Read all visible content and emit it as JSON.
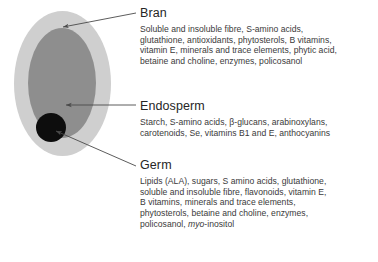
{
  "figure": {
    "colors": {
      "bran": "#cfcfcf",
      "endosperm": "#8e8e8e",
      "germ": "#0d0d0d",
      "leader_line": "#5a5a5a",
      "heading_text": "#262626",
      "body_text": "#3a3a3a"
    },
    "parts": [
      {
        "id": "bran",
        "heading": "Bran",
        "body": "Soluble and insoluble fibre, S-amino acids, glutathione, antioxidants, phytosterols, B vitamins, vitamin E, minerals and trace elements, phytic acid, betaine and choline, enzymes, policosanol",
        "lines": [
          "Soluble and insoluble fibre, S-amino acids,",
          "glutathione, antioxidants, phytosterols, B vitamins,",
          "vitamin E, minerals and trace elements, phytic acid,",
          "betaine and choline, enzymes, policosanol"
        ]
      },
      {
        "id": "endosperm",
        "heading": "Endosperm",
        "body": "Starch, S-amino acids, β-glucans, arabinoxylans, carotenoids, Se, vitamins B1 and E, anthocyanins",
        "lines": [
          "Starch, S-amino acids, β-glucans, arabinoxylans,",
          "carotenoids, Se, vitamins B1 and E, anthocyanins"
        ]
      },
      {
        "id": "germ",
        "heading": "Germ",
        "body": "Lipids (ALA), sugars, S amino acids, glutathione, soluble and insoluble fibre, flavonoids, vitamin E, B vitamins, minerals and trace elements, phytosterols, betaine and choline, enzymes, policosanol, myo-inositol",
        "lines": [
          "Lipids (ALA), sugars, S amino acids, glutathione,",
          "soluble and insoluble fibre, flavonoids, vitamin E,",
          "B vitamins, minerals and trace elements,",
          "phytosterols, betaine and choline, enzymes,",
          "policosanol, "
        ],
        "last_line_italic": "myo",
        "last_line_tail": "-inositol"
      }
    ],
    "caption": ""
  }
}
